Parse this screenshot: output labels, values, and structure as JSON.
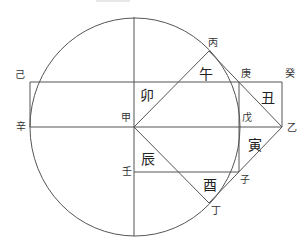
{
  "diagram": {
    "type": "geometric-construction",
    "stroke_color": "#555555",
    "circle": {
      "cx": 135,
      "cy": 127,
      "rx": 105,
      "ry": 109
    },
    "caption_residue": {
      "x1": 96,
      "x2": 130,
      "y": 1
    },
    "lines": [
      {
        "name": "vertical-diameter",
        "x1": 134,
        "y1": 17,
        "x2": 134,
        "y2": 236
      },
      {
        "name": "top-edge",
        "x1": 30,
        "y1": 82,
        "x2": 282,
        "y2": 82
      },
      {
        "name": "left-edge",
        "x1": 30,
        "y1": 82,
        "x2": 30,
        "y2": 127
      },
      {
        "name": "middle-horizontal",
        "x1": 30,
        "y1": 127,
        "x2": 282,
        "y2": 127
      },
      {
        "name": "right-edge",
        "x1": 282,
        "y1": 82,
        "x2": 282,
        "y2": 127
      },
      {
        "name": "geng-vertical",
        "x1": 239,
        "y1": 82,
        "x2": 239,
        "y2": 172
      },
      {
        "name": "ren-horizontal",
        "x1": 134,
        "y1": 172,
        "x2": 239,
        "y2": 172
      },
      {
        "name": "jia-to-bing",
        "x1": 134,
        "y1": 127,
        "x2": 209,
        "y2": 51
      },
      {
        "name": "bing-to-yi",
        "x1": 209,
        "y1": 51,
        "x2": 282,
        "y2": 127
      },
      {
        "name": "jia-to-ding",
        "x1": 134,
        "y1": 127,
        "x2": 209,
        "y2": 203
      },
      {
        "name": "yi-to-ding",
        "x1": 282,
        "y1": 127,
        "x2": 209,
        "y2": 203
      }
    ],
    "point_labels": [
      {
        "id": "bing",
        "text": "丙",
        "x": 213,
        "y": 43
      },
      {
        "id": "ji",
        "text": "己",
        "x": 20,
        "y": 75
      },
      {
        "id": "geng",
        "text": "庚",
        "x": 246,
        "y": 74
      },
      {
        "id": "gui",
        "text": "癸",
        "x": 290,
        "y": 74
      },
      {
        "id": "xin",
        "text": "辛",
        "x": 21,
        "y": 127
      },
      {
        "id": "jia",
        "text": "甲",
        "x": 126,
        "y": 118
      },
      {
        "id": "wu",
        "text": "戊",
        "x": 247,
        "y": 118
      },
      {
        "id": "yi",
        "text": "乙",
        "x": 292,
        "y": 128
      },
      {
        "id": "ren",
        "text": "壬",
        "x": 127,
        "y": 172
      },
      {
        "id": "zi",
        "text": "子",
        "x": 245,
        "y": 180
      },
      {
        "id": "ding",
        "text": "丁",
        "x": 216,
        "y": 211
      }
    ],
    "region_labels": [
      {
        "id": "mao",
        "text": "卯",
        "x": 147,
        "y": 95
      },
      {
        "id": "wu-horse",
        "text": "午",
        "x": 206,
        "y": 74
      },
      {
        "id": "chou",
        "text": "丑",
        "x": 268,
        "y": 98
      },
      {
        "id": "yin",
        "text": "寅",
        "x": 255,
        "y": 145
      },
      {
        "id": "chen",
        "text": "辰",
        "x": 148,
        "y": 159
      },
      {
        "id": "you",
        "text": "酉",
        "x": 210,
        "y": 185
      }
    ]
  }
}
